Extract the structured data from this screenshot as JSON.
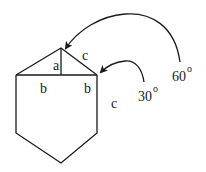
{
  "diagram": {
    "labels": {
      "a": "a",
      "b_left": "b",
      "b_right": "b",
      "c_top": "c",
      "c_side": "c"
    },
    "angles": {
      "apex": {
        "value": "60",
        "unit": "o"
      },
      "corner": {
        "value": "30",
        "unit": "o"
      }
    },
    "colors": {
      "line": "#1a1a1a",
      "background": "#ffffff"
    }
  }
}
